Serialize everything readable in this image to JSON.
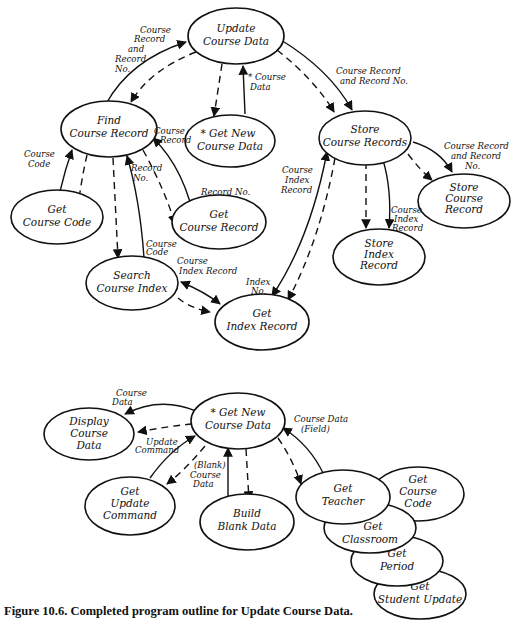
{
  "nodes": {
    "update_course_data": [
      "Update",
      "Course Data"
    ],
    "find_course_record": [
      "Find",
      "Course Record"
    ],
    "get_new_course_data_top": [
      "* Get New",
      "Course Data"
    ],
    "store_course_records": [
      "Store",
      "Course Records"
    ],
    "get_course_code": [
      "Get",
      "Course Code"
    ],
    "get_course_record": [
      "Get",
      "Course Record"
    ],
    "search_course_index": [
      "Search",
      "Course Index"
    ],
    "get_index_record": [
      "Get",
      "Index Record"
    ],
    "store_index_record": [
      "Store",
      "Index",
      "Record"
    ],
    "store_course_record": [
      "Store",
      "Course",
      "Record"
    ],
    "get_new_course_data": [
      "* Get New",
      "Course Data"
    ],
    "display_course_data": [
      "Display",
      "Course",
      "Data"
    ],
    "get_update_command": [
      "Get",
      "Update",
      "Command"
    ],
    "build_blank_data": [
      "Build",
      "Blank Data"
    ],
    "get_teacher": [
      "Get",
      "Teacher"
    ],
    "get_course_code_2": [
      "Get",
      "Course",
      "Code"
    ],
    "get_classroom": [
      "Get",
      "Classroom"
    ],
    "get_period": [
      "Get",
      "Period"
    ],
    "get_student_update": [
      "Get",
      "Student Update"
    ]
  },
  "flow_labels": {
    "course_record_and_record_no_left": [
      "Course",
      "Record",
      "and",
      "Record",
      "No."
    ],
    "course_data_top": [
      "* Course",
      "Data"
    ],
    "course_record_and_record_no_right": [
      "Course Record",
      "and Record No."
    ],
    "course_code": [
      "Course",
      "Code"
    ],
    "course_record_mid": [
      "Course",
      "Record"
    ],
    "record_no_mid": [
      "Record",
      "No."
    ],
    "record_no_get": [
      "Record No."
    ],
    "course_index_record_left": [
      "Course",
      "Index",
      "Record"
    ],
    "course_record_and_record_no_store": [
      "Course Record",
      "and Record",
      "No."
    ],
    "course_index_record_store": [
      "Course",
      "Index",
      "Record"
    ],
    "course_code_search": [
      "Course",
      "Code"
    ],
    "course_index_record_search": [
      "Course",
      "Index Record"
    ],
    "index_no": [
      "Index",
      "No."
    ],
    "course_data_display": [
      "Course",
      "Data"
    ],
    "update_command": [
      "Update",
      "Command"
    ],
    "blank_course_data": [
      "(Blank)",
      "Course",
      "Data"
    ],
    "course_data_field": [
      "Course Data",
      "(Field)"
    ]
  },
  "caption": "Figure 10.6. Completed program outline for Update Course Data."
}
